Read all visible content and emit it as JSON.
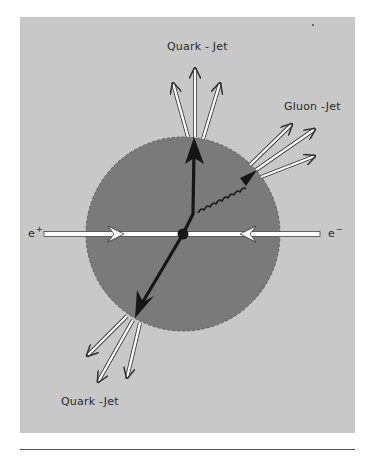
{
  "figure": {
    "colors": {
      "page_background": "#ffffff",
      "panel_background": "#c8c8c8",
      "interaction_region": "#7a7a7a",
      "quark_arrow": "#161616",
      "hadron_arrows": "#ffffff",
      "label_text": "#2a2a2a"
    },
    "labels": {
      "quark_jet_top": "Quark - Jet",
      "gluon_jet": "Gluon -Jet",
      "quark_jet_bottom": "Quark -Jet",
      "positron_base": "e",
      "positron_sign": "+",
      "electron_base": "e",
      "electron_sign": "−"
    },
    "elements": [
      {
        "id": "interaction-sphere",
        "shape": "circle",
        "center": [
          183,
          234
        ],
        "radius": 97
      },
      {
        "id": "beam-line",
        "from": [
          44,
          234
        ],
        "to": [
          320,
          234
        ]
      },
      {
        "id": "quark-top",
        "type": "black-arrow",
        "direction": "up"
      },
      {
        "id": "quark-bottom",
        "type": "black-arrow",
        "direction": "down-left"
      },
      {
        "id": "gluon",
        "type": "curly-line",
        "direction": "up-right"
      },
      {
        "id": "jet-top",
        "hadron_count": 3
      },
      {
        "id": "jet-gluon",
        "hadron_count": 3
      },
      {
        "id": "jet-bottom",
        "hadron_count": 3
      }
    ]
  }
}
